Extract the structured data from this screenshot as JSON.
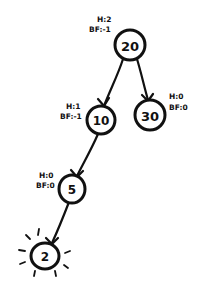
{
  "diagram": {
    "type": "binary-search-tree",
    "style": "hand-drawn",
    "nodes": [
      {
        "id": "n20",
        "value": "20",
        "height_label": "H:2",
        "bf_label": "BF:-1"
      },
      {
        "id": "n10",
        "value": "10",
        "height_label": "H:1",
        "bf_label": "BF:-1"
      },
      {
        "id": "n30",
        "value": "30",
        "height_label": "H:0",
        "bf_label": "BF:0"
      },
      {
        "id": "n5",
        "value": "5",
        "height_label": "H:0",
        "bf_label": "BF:0"
      },
      {
        "id": "n2",
        "value": "2",
        "highlighted": true
      }
    ],
    "edges": [
      {
        "from": "20",
        "to": "10"
      },
      {
        "from": "20",
        "to": "30"
      },
      {
        "from": "10",
        "to": "5"
      },
      {
        "from": "5",
        "to": "2"
      }
    ],
    "colors": {
      "ink": "#111111",
      "background": "#ffffff"
    }
  }
}
